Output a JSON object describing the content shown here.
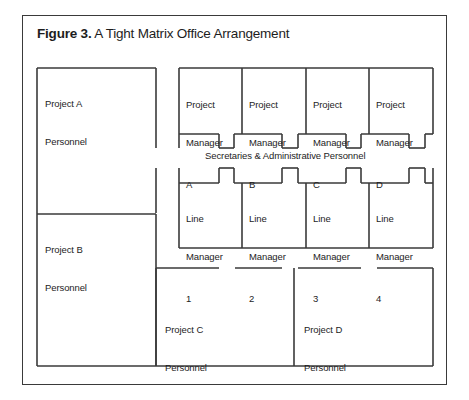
{
  "figure": {
    "label": "Figure 3.",
    "title": "A Tight Matrix Office Arrangement",
    "caption_full": "Figure 3. A Tight Matrix Office Arrangement"
  },
  "colors": {
    "wall": "#3a3a3a",
    "background": "#ffffff",
    "text": "#1d1d1d"
  },
  "floor_plan": {
    "left_column": {
      "rooms": [
        {
          "name": "project-a",
          "line1": "Project A",
          "line2": "Personnel"
        },
        {
          "name": "project-b",
          "line1": "Project B",
          "line2": "Personnel"
        }
      ]
    },
    "project_managers": {
      "role": "Project",
      "role2": "Manager",
      "rooms": [
        {
          "title1": "Project",
          "title2": "Manager",
          "id": "A"
        },
        {
          "title1": "Project",
          "title2": "Manager",
          "id": "B"
        },
        {
          "title1": "Project",
          "title2": "Manager",
          "id": "C"
        },
        {
          "title1": "Project",
          "title2": "Manager",
          "id": "D"
        }
      ]
    },
    "corridor": {
      "label": "Secretaries & Administrative Personnel"
    },
    "line_managers": {
      "rooms": [
        {
          "title1": "Line",
          "title2": "Manager",
          "id": "1"
        },
        {
          "title1": "Line",
          "title2": "Manager",
          "id": "2"
        },
        {
          "title1": "Line",
          "title2": "Manager",
          "id": "3"
        },
        {
          "title1": "Line",
          "title2": "Manager",
          "id": "4"
        }
      ]
    },
    "bottom_rooms": [
      {
        "name": "project-c",
        "line1": "Project C",
        "line2": "Personnel"
      },
      {
        "name": "project-d",
        "line1": "Project D",
        "line2": "Personnel"
      }
    ]
  }
}
